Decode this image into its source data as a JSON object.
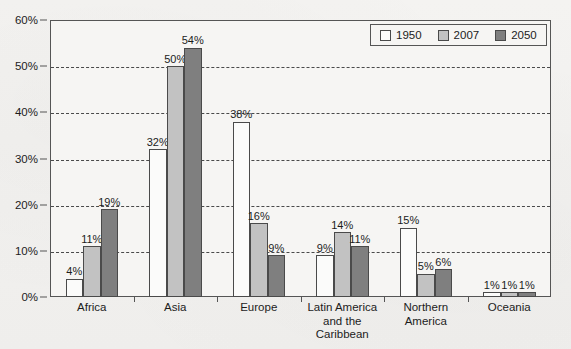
{
  "chart_data": {
    "type": "bar",
    "title": "",
    "subtitle": "",
    "xlabel": "",
    "ylabel": "",
    "ylim": [
      0,
      60
    ],
    "ytick_labels": [
      "0%",
      "10%",
      "20%",
      "30%",
      "40%",
      "50%",
      "60%"
    ],
    "ytick_values": [
      0,
      10,
      20,
      30,
      40,
      50,
      60
    ],
    "grid": true,
    "grid_axis": "y",
    "grid_style": "dashed",
    "legend_position": "top-right",
    "value_labels_suffix": "%",
    "categories": [
      "Africa",
      "Asia",
      "Europe",
      "Latin America and the Caribbean",
      "Northern America",
      "Oceania"
    ],
    "category_label_lines": [
      [
        "Africa"
      ],
      [
        "Asia"
      ],
      [
        "Europe"
      ],
      [
        "Latin America",
        "and the",
        "Caribbean"
      ],
      [
        "Northern",
        "America"
      ],
      [
        "Oceania"
      ]
    ],
    "series": [
      {
        "name": "1950",
        "color": "#fbfbfa",
        "values": [
          4,
          32,
          38,
          9,
          15,
          1
        ],
        "value_labels": [
          "4%",
          "32%",
          "38%",
          "9%",
          "15%",
          "1%"
        ]
      },
      {
        "name": "2007",
        "color": "#c2c2c2",
        "values": [
          11,
          50,
          16,
          14,
          5,
          1
        ],
        "value_labels": [
          "11%",
          "50%",
          "16%",
          "14%",
          "5%",
          "1%"
        ]
      },
      {
        "name": "2050",
        "color": "#7f7f7f",
        "values": [
          19,
          54,
          9,
          11,
          6,
          1
        ],
        "value_labels": [
          "19%",
          "54%",
          "9%",
          "11%",
          "6%",
          "1%"
        ]
      }
    ]
  },
  "legend": {
    "entries": [
      {
        "label": "1950",
        "swatch": "white-swatch"
      },
      {
        "label": "2007",
        "swatch": "light-gray-swatch"
      },
      {
        "label": "2050",
        "swatch": "dark-gray-swatch"
      }
    ]
  },
  "colors": {
    "series_1950": "#fbfbfa",
    "series_2007": "#c2c2c2",
    "series_2050": "#7f7f7f",
    "axis": "#555555",
    "text": "#1c1c1c",
    "background": "#f2f1ef"
  }
}
